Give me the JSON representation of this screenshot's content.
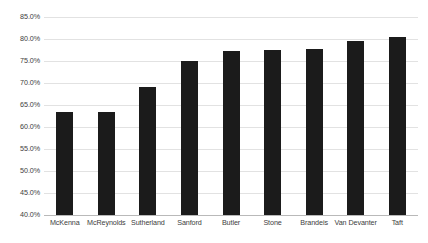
{
  "chart_data": {
    "type": "bar",
    "title": "",
    "subtitle": "",
    "xlabel": "",
    "ylabel": "",
    "categories": [
      "McKenna",
      "McReynolds",
      "Sutherland",
      "Sanford",
      "Butler",
      "Stone",
      "Brandeis",
      "Van Devanter",
      "Taft"
    ],
    "values": [
      63.5,
      63.4,
      69.2,
      75.0,
      77.2,
      77.5,
      77.8,
      79.5,
      80.5
    ],
    "ylim": [
      40.0,
      85.0
    ],
    "ytick_values": [
      85.0,
      80.0,
      75.0,
      70.0,
      65.0,
      60.0,
      55.0,
      50.0,
      45.0,
      40.0
    ],
    "ytick_labels": [
      "85.0%",
      "80.0%",
      "75.0%",
      "70.0%",
      "65.0%",
      "60.0%",
      "55.0%",
      "50.0%",
      "45.0%",
      "40.0%"
    ],
    "value_format": "percent",
    "grid": true,
    "grid_axis": "y",
    "legend": false,
    "legend_position": "none",
    "bar_color": "#1b1b1b",
    "gridline_color": "#e2e2e2",
    "axis_color": "#b9b9b9",
    "background_color": "#ffffff"
  }
}
